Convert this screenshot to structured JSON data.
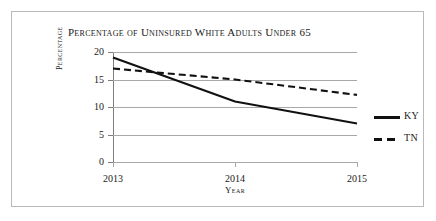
{
  "chart_data": {
    "type": "line",
    "title": "Percentage of Uninsured White Adults Under 65",
    "xlabel": "Year",
    "ylabel": "Percentage",
    "categories": [
      "2013",
      "2014",
      "2015"
    ],
    "x": [
      2013,
      2014,
      2015
    ],
    "xlim": [
      2013,
      2015
    ],
    "ylim": [
      0,
      20
    ],
    "yticks": [
      0,
      5,
      10,
      15,
      20
    ],
    "ytick_labels": [
      "0",
      "5",
      "10",
      "15",
      "20"
    ],
    "grid": true,
    "legend_position": "right",
    "series": [
      {
        "name": "KY",
        "values": [
          19,
          11,
          7
        ],
        "style": "solid",
        "color": "#111111"
      },
      {
        "name": "TN",
        "values": [
          17,
          15,
          12.2
        ],
        "style": "dashed",
        "color": "#111111"
      }
    ]
  },
  "legend": {
    "entries": [
      {
        "label": "KY",
        "style": "solid"
      },
      {
        "label": "TN",
        "style": "dashed"
      }
    ]
  }
}
